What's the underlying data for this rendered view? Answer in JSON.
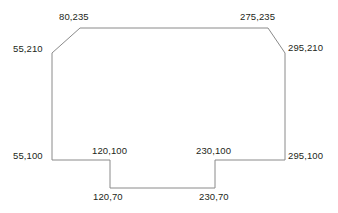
{
  "diagram": {
    "type": "polygon-coordinate-outline",
    "stroke_color": "#8a8a8a",
    "fill_color": "#ffffff",
    "background_color": "#ffffff",
    "text_color": "#231f20",
    "canvas": {
      "width": 338,
      "height": 213
    },
    "polygon_points_px": "80,28 268,28 285,53 285,160 215,160 215,188 110,188 110,160 52,160 52,53",
    "vertices": [
      {
        "label": "80,235",
        "model_x": 80,
        "model_y": 235,
        "px": [
          80,
          28
        ],
        "label_px": [
          59,
          11
        ]
      },
      {
        "label": "275,235",
        "model_x": 275,
        "model_y": 235,
        "px": [
          268,
          28
        ],
        "label_px": [
          240,
          11
        ]
      },
      {
        "label": "295,210",
        "model_x": 295,
        "model_y": 210,
        "px": [
          285,
          53
        ],
        "label_px": [
          288,
          42
        ]
      },
      {
        "label": "295,100",
        "model_x": 295,
        "model_y": 100,
        "px": [
          285,
          160
        ],
        "label_px": [
          288,
          150
        ]
      },
      {
        "label": "230,100",
        "model_x": 230,
        "model_y": 100,
        "px": [
          215,
          160
        ],
        "label_px": [
          196,
          145
        ]
      },
      {
        "label": "230,70",
        "model_x": 230,
        "model_y": 70,
        "px": [
          215,
          188
        ],
        "label_px": [
          199,
          191
        ]
      },
      {
        "label": "120,70",
        "model_x": 120,
        "model_y": 70,
        "px": [
          110,
          188
        ],
        "label_px": [
          93,
          191
        ]
      },
      {
        "label": "120,100",
        "model_x": 120,
        "model_y": 100,
        "px": [
          110,
          160
        ],
        "label_px": [
          92,
          145
        ]
      },
      {
        "label": "55,100",
        "model_x": 55,
        "model_y": 100,
        "px": [
          52,
          160
        ],
        "label_px": [
          13,
          150
        ]
      },
      {
        "label": "55,210",
        "model_x": 55,
        "model_y": 210,
        "px": [
          52,
          53
        ],
        "label_px": [
          13,
          43
        ]
      }
    ]
  }
}
